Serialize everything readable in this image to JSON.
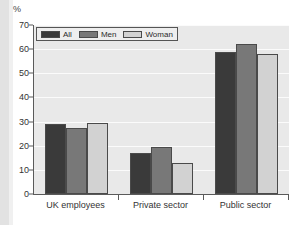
{
  "figure": {
    "unit_label": "%",
    "background_color": "#ffffff",
    "plot_background_color": "#e9e9e9",
    "gridline_color": "#fbfbfb",
    "axis_color": "#5a5a5a"
  },
  "legend": {
    "position": "top-left-inside",
    "entries": [
      {
        "label": "All",
        "color": "#3a3a3a"
      },
      {
        "label": "Men",
        "color": "#787878"
      },
      {
        "label": "Woman",
        "color": "#d2d2d2"
      }
    ]
  },
  "chart_data": {
    "type": "bar",
    "title": "",
    "subtitle": "",
    "xlabel": "",
    "ylabel": "%",
    "ylim": [
      0,
      70
    ],
    "ytick_step": 10,
    "yticks": [
      0,
      10,
      20,
      30,
      40,
      50,
      60,
      70
    ],
    "ytick_labels": [
      "0",
      "10",
      "20",
      "30",
      "40",
      "50",
      "60",
      "70"
    ],
    "grid": true,
    "grid_axis": "y",
    "legend_position": "upper left",
    "categories": [
      "UK employees",
      "Private sector",
      "Public sector"
    ],
    "series": [
      {
        "name": "All",
        "color": "#3a3a3a",
        "values": [
          29.0,
          17.0,
          59.0
        ]
      },
      {
        "name": "Men",
        "color": "#787878",
        "values": [
          27.3,
          19.3,
          62.0
        ]
      },
      {
        "name": "Woman",
        "color": "#d2d2d2",
        "values": [
          29.6,
          13.0,
          58.0
        ]
      }
    ],
    "annotations": []
  }
}
